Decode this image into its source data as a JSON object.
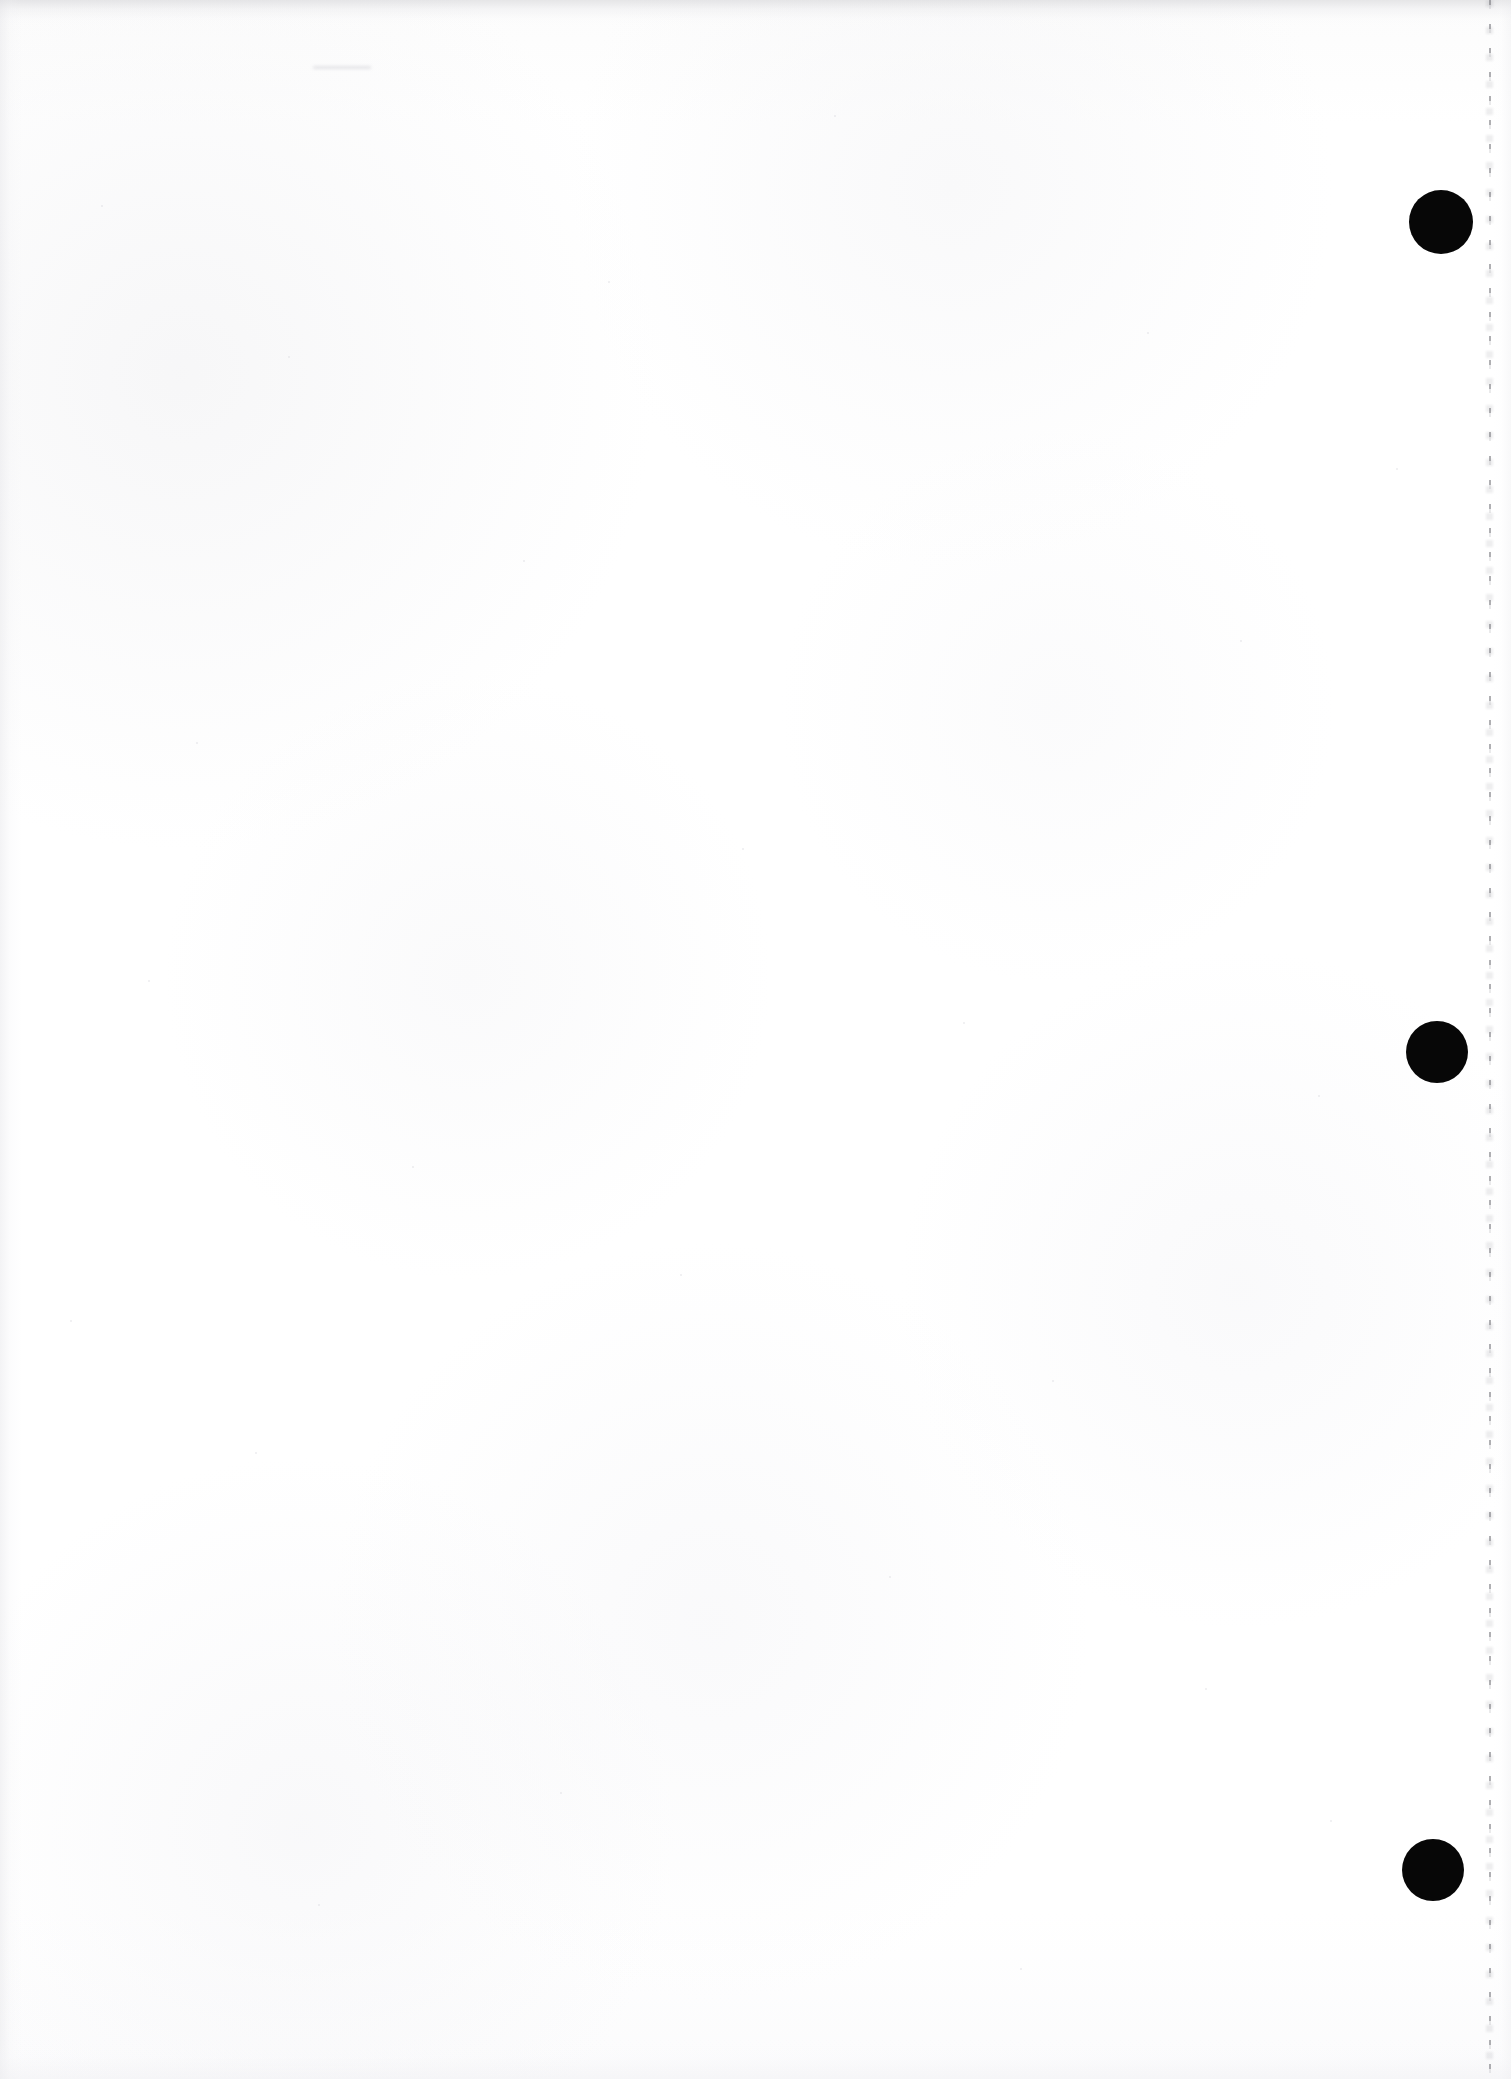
{
  "document": {
    "kind": "scanned-page",
    "description": "Blank scanned document page",
    "page_width": 1511,
    "page_height": 2079,
    "background_color": "#fdfdfd",
    "body_text": "",
    "visible_text": "",
    "mark_color": "#070707"
  },
  "registration_marks": [
    {
      "id": "mark-top",
      "label": "",
      "cx": 1441,
      "cy": 222,
      "r": 32,
      "color": "#070707"
    },
    {
      "id": "mark-middle",
      "label": "",
      "cx": 1437,
      "cy": 1052,
      "r": 31,
      "color": "#070707"
    },
    {
      "id": "mark-bottom",
      "label": "",
      "cx": 1433,
      "cy": 1870,
      "r": 31,
      "color": "#070707"
    }
  ],
  "edge_artifact": {
    "id": "right-edge-dotted-line",
    "x": 1489,
    "y": 0,
    "height": 2079,
    "color": "#76767c"
  },
  "smudges": [
    {
      "id": "top-smudge",
      "x": 313,
      "y": 66,
      "width": 58,
      "height": 3
    }
  ],
  "specks": [
    {
      "x": 101,
      "y": 205,
      "d": 2
    },
    {
      "x": 288,
      "y": 356,
      "d": 2
    },
    {
      "x": 608,
      "y": 281,
      "d": 2
    },
    {
      "x": 834,
      "y": 115,
      "d": 2
    },
    {
      "x": 1147,
      "y": 332,
      "d": 2
    },
    {
      "x": 1240,
      "y": 640,
      "d": 2
    },
    {
      "x": 523,
      "y": 560,
      "d": 2
    },
    {
      "x": 196,
      "y": 742,
      "d": 2
    },
    {
      "x": 742,
      "y": 848,
      "d": 2
    },
    {
      "x": 963,
      "y": 1022,
      "d": 2
    },
    {
      "x": 1318,
      "y": 1095,
      "d": 2
    },
    {
      "x": 412,
      "y": 1166,
      "d": 2
    },
    {
      "x": 680,
      "y": 1274,
      "d": 2
    },
    {
      "x": 1052,
      "y": 1380,
      "d": 2
    },
    {
      "x": 255,
      "y": 1452,
      "d": 2
    },
    {
      "x": 889,
      "y": 1576,
      "d": 2
    },
    {
      "x": 1205,
      "y": 1688,
      "d": 2
    },
    {
      "x": 560,
      "y": 1792,
      "d": 2
    },
    {
      "x": 318,
      "y": 1904,
      "d": 2
    },
    {
      "x": 1020,
      "y": 1968,
      "d": 2
    },
    {
      "x": 148,
      "y": 980,
      "d": 2
    },
    {
      "x": 1396,
      "y": 468,
      "d": 2
    },
    {
      "x": 70,
      "y": 1320,
      "d": 2
    },
    {
      "x": 1330,
      "y": 1820,
      "d": 2
    }
  ]
}
